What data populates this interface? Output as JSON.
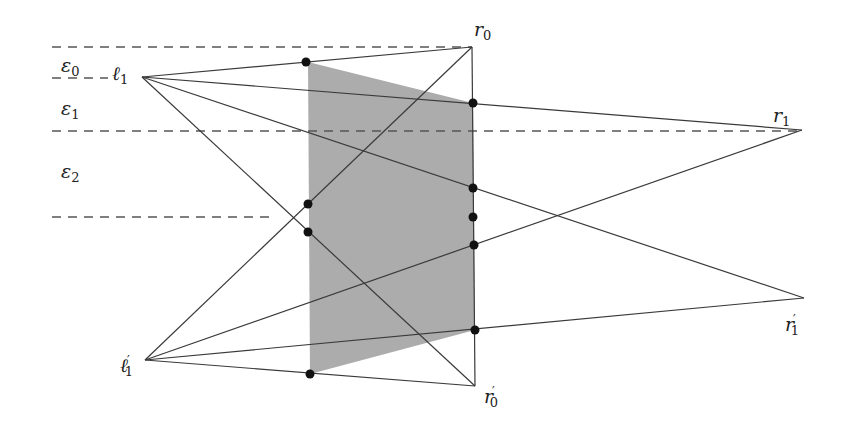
{
  "diagram": {
    "type": "geometric-construction",
    "colors": {
      "line": "#3a3a3a",
      "dash": "#555555",
      "shade": "#a8a8a8",
      "dot": "#111111",
      "background": "#ffffff"
    },
    "bands": [
      {
        "id": "eps0",
        "symbol": "ε",
        "sub": "0"
      },
      {
        "id": "eps1",
        "symbol": "ε",
        "sub": "1"
      },
      {
        "id": "eps2",
        "symbol": "ε",
        "sub": "2"
      }
    ],
    "points": {
      "l1": {
        "symbol": "ℓ",
        "sub": "1",
        "prime": ""
      },
      "l1p": {
        "symbol": "ℓ",
        "sub": "1",
        "prime": "′"
      },
      "r0": {
        "symbol": "r",
        "sub": "0",
        "prime": ""
      },
      "r0p": {
        "symbol": "r",
        "sub": "0",
        "prime": "′"
      },
      "r1": {
        "symbol": "r",
        "sub": "1",
        "prime": ""
      },
      "r1p": {
        "symbol": "r",
        "sub": "1",
        "prime": "′"
      }
    },
    "segments": [
      [
        "l1",
        "r0"
      ],
      [
        "l1",
        "r1"
      ],
      [
        "l1",
        "r1p"
      ],
      [
        "l1",
        "r0p"
      ],
      [
        "l1p",
        "r0"
      ],
      [
        "l1p",
        "r1"
      ],
      [
        "l1p",
        "r1p"
      ],
      [
        "l1p",
        "r0p"
      ],
      [
        "r0",
        "r0p"
      ]
    ],
    "marked_intersections": 9,
    "shaded_region": "trapezoid between left vertical and segment r0–r0′"
  }
}
